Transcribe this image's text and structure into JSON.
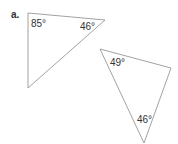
{
  "part_label": "a.",
  "colors": {
    "stroke": "#8a8a8a",
    "text": "#333333"
  },
  "triangles": [
    {
      "name": "triangle-1",
      "angles": [
        {
          "label": "85°",
          "vertex": "top-left"
        },
        {
          "label": "46°",
          "vertex": "right"
        }
      ]
    },
    {
      "name": "triangle-2",
      "angles": [
        {
          "label": "49°",
          "vertex": "top-left"
        },
        {
          "label": "46°",
          "vertex": "bottom"
        }
      ]
    }
  ]
}
